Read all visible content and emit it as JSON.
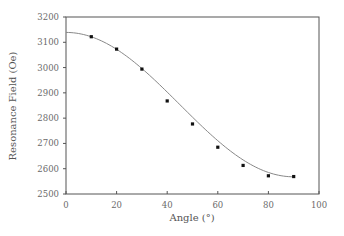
{
  "chart_data": {
    "type": "scatter",
    "title": "",
    "xlabel": "Angle (°)",
    "ylabel": "Resonance Field (Oe)",
    "xlim": [
      0,
      100
    ],
    "ylim": [
      2500,
      3200
    ],
    "x_ticks": [
      0,
      20,
      40,
      60,
      80,
      100
    ],
    "y_ticks": [
      2500,
      2600,
      2700,
      2800,
      2900,
      3000,
      3100,
      3200
    ],
    "grid": false,
    "legend": null,
    "series": [
      {
        "name": "measured",
        "kind": "scatter",
        "marker": "square",
        "color": "#111111",
        "x": [
          10,
          20,
          30,
          40,
          50,
          60,
          70,
          80,
          90
        ],
        "y": [
          3122,
          3073,
          2994,
          2868,
          2777,
          2685,
          2613,
          2572,
          2569
        ]
      },
      {
        "name": "fit",
        "kind": "line",
        "color": "#888888",
        "x": [
          0,
          10,
          20,
          30,
          40,
          50,
          60,
          70,
          80,
          90
        ],
        "y": [
          3139,
          3122,
          3072,
          2996,
          2903,
          2804,
          2711,
          2635,
          2585,
          2568
        ]
      }
    ]
  },
  "colors": {
    "frame": "#555555",
    "marker": "#111111",
    "fit_line": "#888888",
    "text": "#6a6a6a"
  }
}
